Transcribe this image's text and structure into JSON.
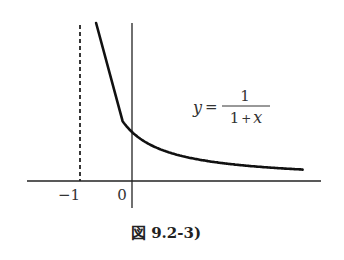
{
  "figure": {
    "caption": "図 9.2-3)",
    "equation": {
      "lhs": "y",
      "eq": "=",
      "numerator": "1",
      "denominator": "1 + x"
    },
    "x_ticks": [
      "−1",
      "0"
    ],
    "colors": {
      "curve": "#111111",
      "axis": "#222222",
      "text": "#333333"
    }
  },
  "chart_data": {
    "type": "line",
    "function": "y = 1/(1+x)",
    "xlabel": "",
    "ylabel": "",
    "x_ticks": [
      -1,
      0
    ],
    "asymptotes": {
      "vertical": -1,
      "horizontal": 0
    },
    "x": [
      -0.8,
      -0.6,
      -0.4,
      -0.2,
      0,
      0.5,
      1,
      1.5,
      2,
      2.5,
      3,
      3.3
    ],
    "values": [
      5.0,
      2.5,
      1.667,
      1.25,
      1.0,
      0.667,
      0.5,
      0.4,
      0.333,
      0.286,
      0.25,
      0.233
    ],
    "grid": false
  }
}
